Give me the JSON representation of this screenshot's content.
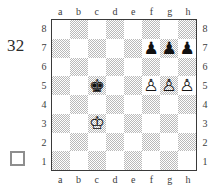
{
  "diagram": {
    "move_number": "32",
    "side_to_move_label": "",
    "side_to_move": "white",
    "side_to_move_icon": "white-square-icon"
  },
  "board": {
    "files_top": [
      "a",
      "b",
      "c",
      "d",
      "e",
      "f",
      "g",
      "h"
    ],
    "files_bottom": [
      "a",
      "b",
      "c",
      "d",
      "e",
      "f",
      "g",
      "h"
    ],
    "ranks_left": [
      "8",
      "7",
      "6",
      "5",
      "4",
      "3",
      "2",
      "1"
    ],
    "ranks_right": [
      "8",
      "7",
      "6",
      "5",
      "4",
      "3",
      "2",
      "1"
    ],
    "light_square_color": "#ffffff",
    "dark_square_color": "#b9b9b9",
    "border_color": "#3a3a3a",
    "orientation": "white",
    "rows": [
      [
        {
          "square": "a8",
          "shade": "light",
          "piece": null
        },
        {
          "square": "b8",
          "shade": "dark",
          "piece": null
        },
        {
          "square": "c8",
          "shade": "light",
          "piece": null
        },
        {
          "square": "d8",
          "shade": "dark",
          "piece": null
        },
        {
          "square": "e8",
          "shade": "light",
          "piece": null
        },
        {
          "square": "f8",
          "shade": "dark",
          "piece": null
        },
        {
          "square": "g8",
          "shade": "light",
          "piece": null
        },
        {
          "square": "h8",
          "shade": "dark",
          "piece": null
        }
      ],
      [
        {
          "square": "a7",
          "shade": "dark",
          "piece": null
        },
        {
          "square": "b7",
          "shade": "light",
          "piece": null
        },
        {
          "square": "c7",
          "shade": "dark",
          "piece": null
        },
        {
          "square": "d7",
          "shade": "light",
          "piece": null
        },
        {
          "square": "e7",
          "shade": "dark",
          "piece": null
        },
        {
          "square": "f7",
          "shade": "light",
          "piece": {
            "color": "black",
            "type": "pawn",
            "glyph": "♟",
            "name": "black-pawn"
          }
        },
        {
          "square": "g7",
          "shade": "dark",
          "piece": {
            "color": "black",
            "type": "pawn",
            "glyph": "♟",
            "name": "black-pawn"
          }
        },
        {
          "square": "h7",
          "shade": "light",
          "piece": {
            "color": "black",
            "type": "pawn",
            "glyph": "♟",
            "name": "black-pawn"
          }
        }
      ],
      [
        {
          "square": "a6",
          "shade": "light",
          "piece": null
        },
        {
          "square": "b6",
          "shade": "dark",
          "piece": null
        },
        {
          "square": "c6",
          "shade": "light",
          "piece": null
        },
        {
          "square": "d6",
          "shade": "dark",
          "piece": null
        },
        {
          "square": "e6",
          "shade": "light",
          "piece": null
        },
        {
          "square": "f6",
          "shade": "dark",
          "piece": null
        },
        {
          "square": "g6",
          "shade": "light",
          "piece": null
        },
        {
          "square": "h6",
          "shade": "dark",
          "piece": null
        }
      ],
      [
        {
          "square": "a5",
          "shade": "dark",
          "piece": null
        },
        {
          "square": "b5",
          "shade": "light",
          "piece": null
        },
        {
          "square": "c5",
          "shade": "dark",
          "piece": {
            "color": "black",
            "type": "king",
            "glyph": "♚",
            "name": "black-king"
          }
        },
        {
          "square": "d5",
          "shade": "light",
          "piece": null
        },
        {
          "square": "e5",
          "shade": "dark",
          "piece": null
        },
        {
          "square": "f5",
          "shade": "light",
          "piece": {
            "color": "white",
            "type": "pawn",
            "glyph": "♙",
            "name": "white-pawn"
          }
        },
        {
          "square": "g5",
          "shade": "dark",
          "piece": {
            "color": "white",
            "type": "pawn",
            "glyph": "♙",
            "name": "white-pawn"
          }
        },
        {
          "square": "h5",
          "shade": "light",
          "piece": {
            "color": "white",
            "type": "pawn",
            "glyph": "♙",
            "name": "white-pawn"
          }
        }
      ],
      [
        {
          "square": "a4",
          "shade": "light",
          "piece": null
        },
        {
          "square": "b4",
          "shade": "dark",
          "piece": null
        },
        {
          "square": "c4",
          "shade": "light",
          "piece": null
        },
        {
          "square": "d4",
          "shade": "dark",
          "piece": null
        },
        {
          "square": "e4",
          "shade": "light",
          "piece": null
        },
        {
          "square": "f4",
          "shade": "dark",
          "piece": null
        },
        {
          "square": "g4",
          "shade": "light",
          "piece": null
        },
        {
          "square": "h4",
          "shade": "dark",
          "piece": null
        }
      ],
      [
        {
          "square": "a3",
          "shade": "dark",
          "piece": null
        },
        {
          "square": "b3",
          "shade": "light",
          "piece": null
        },
        {
          "square": "c3",
          "shade": "dark",
          "piece": {
            "color": "white",
            "type": "king",
            "glyph": "♔",
            "name": "white-king"
          }
        },
        {
          "square": "d3",
          "shade": "light",
          "piece": null
        },
        {
          "square": "e3",
          "shade": "dark",
          "piece": null
        },
        {
          "square": "f3",
          "shade": "light",
          "piece": null
        },
        {
          "square": "g3",
          "shade": "dark",
          "piece": null
        },
        {
          "square": "h3",
          "shade": "light",
          "piece": null
        }
      ],
      [
        {
          "square": "a2",
          "shade": "light",
          "piece": null
        },
        {
          "square": "b2",
          "shade": "dark",
          "piece": null
        },
        {
          "square": "c2",
          "shade": "light",
          "piece": null
        },
        {
          "square": "d2",
          "shade": "dark",
          "piece": null
        },
        {
          "square": "e2",
          "shade": "light",
          "piece": null
        },
        {
          "square": "f2",
          "shade": "dark",
          "piece": null
        },
        {
          "square": "g2",
          "shade": "light",
          "piece": null
        },
        {
          "square": "h2",
          "shade": "dark",
          "piece": null
        }
      ],
      [
        {
          "square": "a1",
          "shade": "dark",
          "piece": null
        },
        {
          "square": "b1",
          "shade": "light",
          "piece": null
        },
        {
          "square": "c1",
          "shade": "dark",
          "piece": null
        },
        {
          "square": "d1",
          "shade": "light",
          "piece": null
        },
        {
          "square": "e1",
          "shade": "dark",
          "piece": null
        },
        {
          "square": "f1",
          "shade": "light",
          "piece": null
        },
        {
          "square": "g1",
          "shade": "dark",
          "piece": null
        },
        {
          "square": "h1",
          "shade": "light",
          "piece": null
        }
      ]
    ]
  }
}
